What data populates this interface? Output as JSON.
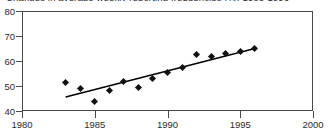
{
  "figure": {
    "title": "Changes in average weekly reporting frequencies (%) 1983-1996",
    "background_color": "#ffffff",
    "axis_color": "#4a4a4a",
    "marker_color": "#111111",
    "trendline_color": "#000000"
  },
  "chart_data": {
    "type": "scatter",
    "title": "Changes in average weekly reporting frequencies (%) 1983-1996",
    "xlabel": "",
    "ylabel": "",
    "xlim": [
      1980,
      2000
    ],
    "ylim": [
      40,
      80
    ],
    "xticks": [
      1980,
      1985,
      1990,
      1995,
      2000
    ],
    "yticks": [
      40,
      50,
      60,
      70,
      80
    ],
    "xtick_labels": [
      "1980",
      "1985",
      "1990",
      "1995",
      "2000"
    ],
    "ytick_labels": [
      "40",
      "50",
      "60",
      "70",
      "80"
    ],
    "grid": false,
    "legend": null,
    "x": [
      1983,
      1984,
      1985,
      1986,
      1987,
      1988,
      1989,
      1990,
      1991,
      1992,
      1993,
      1994,
      1995,
      1996
    ],
    "values": [
      51.4,
      49.2,
      44.0,
      48.3,
      51.7,
      49.6,
      53.2,
      55.4,
      57.3,
      62.8,
      61.7,
      62.9,
      63.8,
      65.2
    ],
    "series": [
      {
        "name": "Average weekly reporting frequency (%)",
        "marker": "diamond",
        "x": [
          1983,
          1984,
          1985,
          1986,
          1987,
          1988,
          1989,
          1990,
          1991,
          1992,
          1993,
          1994,
          1995,
          1996
        ],
        "values": [
          51.4,
          49.2,
          44.0,
          48.3,
          51.7,
          49.6,
          53.2,
          55.4,
          57.3,
          62.8,
          61.7,
          62.9,
          63.8,
          65.2
        ]
      },
      {
        "name": "linear trend",
        "type": "line",
        "x": [
          1983,
          1996
        ],
        "values": [
          45.6,
          65.0
        ]
      }
    ],
    "annotations": []
  }
}
